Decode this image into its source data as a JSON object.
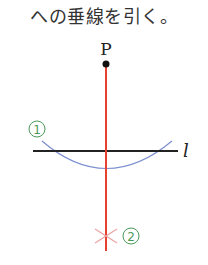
{
  "caption": "への垂線を引く。",
  "diagram": {
    "point_label": "P",
    "line_label": "l",
    "step1_label": "1",
    "step2_label": "2",
    "colors": {
      "perpendicular": "#e8402e",
      "line": "#222222",
      "arc": "#7d8fd0",
      "mark": "#e89a9a",
      "circle_label": "#4a9a5a"
    }
  }
}
